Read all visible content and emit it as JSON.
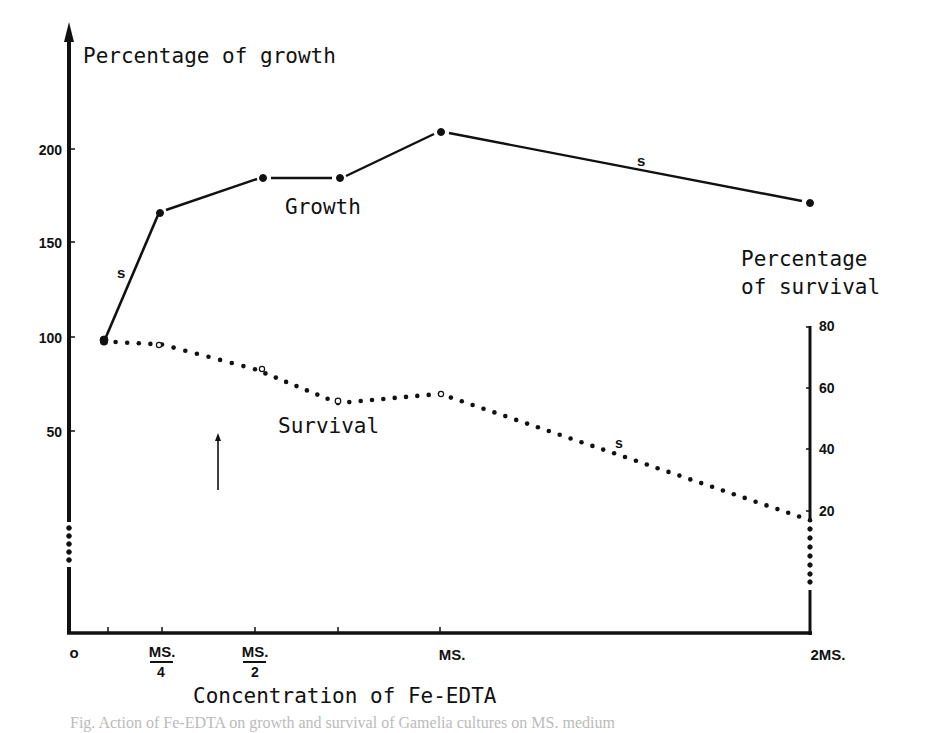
{
  "chart_data": {
    "type": "line",
    "title": "",
    "xlabel": "Concentration of Fe-EDTA",
    "ylabel": "Percentage of growth",
    "y2label": [
      "Percentage",
      "of survival"
    ],
    "categories": [
      "",
      "M.S./4",
      "M.S./2",
      "",
      "M.S.",
      "2 M.S."
    ],
    "x_positions": [
      108,
      162,
      255,
      338,
      440,
      810
    ],
    "x_tick_labels": [
      {
        "label": "o",
        "x": 74
      },
      {
        "label": "MS.",
        "sub": "4",
        "x": 162
      },
      {
        "label": "MS.",
        "sub": "2",
        "x": 255
      },
      {
        "label": "MS.",
        "x": 440
      },
      {
        "label": "2 MS.",
        "x": 810
      }
    ],
    "ylim": [
      0,
      220
    ],
    "yticks": [
      50,
      100,
      150,
      200
    ],
    "y2lim": [
      0,
      80
    ],
    "y2ticks": [
      20,
      40,
      60,
      80
    ],
    "series": [
      {
        "name": "Growth",
        "axis": "left",
        "style": "solid",
        "marker": "filled-dot",
        "values": [
          99,
          165,
          184,
          184,
          209,
          172
        ],
        "significance_labels": [
          {
            "segment": "0-1",
            "label": "s"
          },
          {
            "segment": "4-5",
            "label": "s"
          }
        ]
      },
      {
        "name": "Survival",
        "axis": "right",
        "style": "dotted",
        "marker": "open-circle",
        "values": [
          75,
          74,
          66,
          55,
          58,
          17
        ],
        "significance_labels": [
          {
            "segment": "4-5",
            "label": "s"
          }
        ]
      }
    ],
    "annotations": [
      {
        "type": "arrow-up",
        "x": 218,
        "y_from": 490,
        "y_to": 434
      }
    ],
    "grid": false,
    "legend": "inline labels"
  },
  "labels": {
    "y_title": "Percentage of growth",
    "y2_title_line1": "Percentage",
    "y2_title_line2": "of survival",
    "growth_label": "Growth",
    "survival_label": "Survival",
    "x_title": "Concentration of Fe-EDTA",
    "sig": "s",
    "origin": "o",
    "ms": "MS.",
    "ms4_den": "4",
    "ms2_den": "2",
    "ms_full": "MS.",
    "two_ms": "2MS.",
    "y_ticks": [
      "200",
      "150",
      "100",
      "50"
    ],
    "y2_ticks": [
      "80",
      "60",
      "40",
      "20"
    ]
  },
  "caption": "Fig. Action of Fe-EDTA on growth and survival of Gamelia cultures on MS. medium"
}
